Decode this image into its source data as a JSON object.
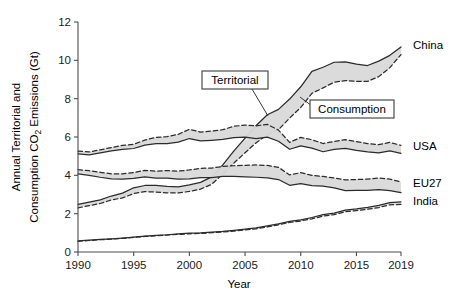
{
  "chart_data": {
    "type": "line",
    "title": "",
    "subtitle": "",
    "xlabel": "Year",
    "ylabel": "Annual Territorial and Consumption CO2 Emissions (Gt)",
    "ylabel_line1": "Annual Territorial and",
    "ylabel_line2_pre": "Consumption CO",
    "ylabel_line2_sub": "2",
    "ylabel_line2_post": " Emissions (Gt)",
    "xlim": [
      1990,
      2019
    ],
    "ylim": [
      0,
      12
    ],
    "xticks": [
      1990,
      1995,
      2000,
      2005,
      2010,
      2015,
      2019
    ],
    "yticks": [
      0,
      2,
      4,
      6,
      8,
      10,
      12
    ],
    "grid": false,
    "legend_position": "inline-annotations",
    "fill_color": "#d9d9d9",
    "line_color": "#2b2b2b",
    "annotations": [
      {
        "name": "territorial",
        "label": "Territorial",
        "style": "solid"
      },
      {
        "name": "consumption",
        "label": "Consumption",
        "style": "dashed"
      }
    ],
    "x": [
      1990,
      1991,
      1992,
      1993,
      1994,
      1995,
      1996,
      1997,
      1998,
      1999,
      2000,
      2001,
      2002,
      2003,
      2004,
      2005,
      2006,
      2007,
      2008,
      2009,
      2010,
      2011,
      2012,
      2013,
      2014,
      2015,
      2016,
      2017,
      2018,
      2019
    ],
    "series": [
      {
        "name": "China",
        "label": "China",
        "territorial": [
          2.48,
          2.6,
          2.72,
          2.92,
          3.07,
          3.35,
          3.47,
          3.47,
          3.42,
          3.4,
          3.5,
          3.63,
          3.92,
          4.54,
          5.28,
          5.94,
          6.6,
          7.16,
          7.44,
          7.98,
          8.62,
          9.42,
          9.64,
          9.9,
          9.92,
          9.8,
          9.73,
          9.96,
          10.26,
          10.7
        ],
        "consumption": [
          2.3,
          2.42,
          2.53,
          2.72,
          2.82,
          3.05,
          3.15,
          3.13,
          3.09,
          3.08,
          3.16,
          3.28,
          3.53,
          4.06,
          4.64,
          5.18,
          5.7,
          6.12,
          6.38,
          6.99,
          7.54,
          8.28,
          8.56,
          8.86,
          8.94,
          8.9,
          8.9,
          9.15,
          9.62,
          10.3
        ]
      },
      {
        "name": "USA",
        "label": "USA",
        "territorial": [
          5.12,
          5.07,
          5.17,
          5.27,
          5.35,
          5.4,
          5.58,
          5.66,
          5.66,
          5.73,
          5.92,
          5.8,
          5.83,
          5.87,
          5.97,
          5.99,
          5.91,
          5.99,
          5.78,
          5.36,
          5.54,
          5.42,
          5.23,
          5.35,
          5.41,
          5.3,
          5.22,
          5.17,
          5.28,
          5.15
        ],
        "consumption": [
          5.26,
          5.22,
          5.33,
          5.45,
          5.56,
          5.62,
          5.84,
          5.98,
          6.02,
          6.14,
          6.4,
          6.26,
          6.31,
          6.38,
          6.56,
          6.62,
          6.58,
          6.66,
          6.36,
          5.72,
          5.98,
          5.86,
          5.66,
          5.76,
          5.86,
          5.76,
          5.66,
          5.6,
          5.72,
          5.56
        ]
      },
      {
        "name": "EU27",
        "label": "EU27",
        "territorial": [
          4.07,
          4.0,
          3.9,
          3.82,
          3.8,
          3.84,
          3.92,
          3.86,
          3.86,
          3.8,
          3.82,
          3.88,
          3.88,
          3.94,
          3.94,
          3.92,
          3.9,
          3.87,
          3.78,
          3.48,
          3.57,
          3.46,
          3.44,
          3.34,
          3.2,
          3.22,
          3.22,
          3.26,
          3.2,
          3.1
        ],
        "consumption": [
          4.3,
          4.24,
          4.16,
          4.08,
          4.08,
          4.15,
          4.26,
          4.22,
          4.25,
          4.22,
          4.28,
          4.36,
          4.38,
          4.46,
          4.5,
          4.52,
          4.54,
          4.52,
          4.42,
          4.02,
          4.14,
          4.0,
          3.94,
          3.86,
          3.76,
          3.78,
          3.8,
          3.86,
          3.8,
          3.66
        ]
      },
      {
        "name": "India",
        "label": "India",
        "territorial": [
          0.58,
          0.62,
          0.66,
          0.69,
          0.73,
          0.78,
          0.83,
          0.87,
          0.9,
          0.95,
          0.98,
          1.0,
          1.04,
          1.07,
          1.13,
          1.19,
          1.26,
          1.36,
          1.47,
          1.6,
          1.68,
          1.8,
          1.95,
          2.03,
          2.19,
          2.25,
          2.33,
          2.43,
          2.58,
          2.62
        ],
        "consumption": [
          0.56,
          0.6,
          0.64,
          0.67,
          0.71,
          0.76,
          0.81,
          0.85,
          0.88,
          0.92,
          0.95,
          0.97,
          1.01,
          1.04,
          1.09,
          1.15,
          1.21,
          1.31,
          1.42,
          1.54,
          1.62,
          1.73,
          1.87,
          1.95,
          2.1,
          2.16,
          2.23,
          2.32,
          2.46,
          2.48
        ]
      }
    ]
  },
  "axes": {
    "x_tick_labels": [
      "1990",
      "1995",
      "2000",
      "2005",
      "2010",
      "2015",
      "2019"
    ],
    "y_tick_labels": [
      "0",
      "2",
      "4",
      "6",
      "8",
      "10",
      "12"
    ],
    "x_axis_title": "Year"
  },
  "callouts": {
    "territorial": "Territorial",
    "consumption": "Consumption"
  },
  "series_labels": {
    "china": "China",
    "usa": "USA",
    "eu27": "EU27",
    "india": "India"
  }
}
